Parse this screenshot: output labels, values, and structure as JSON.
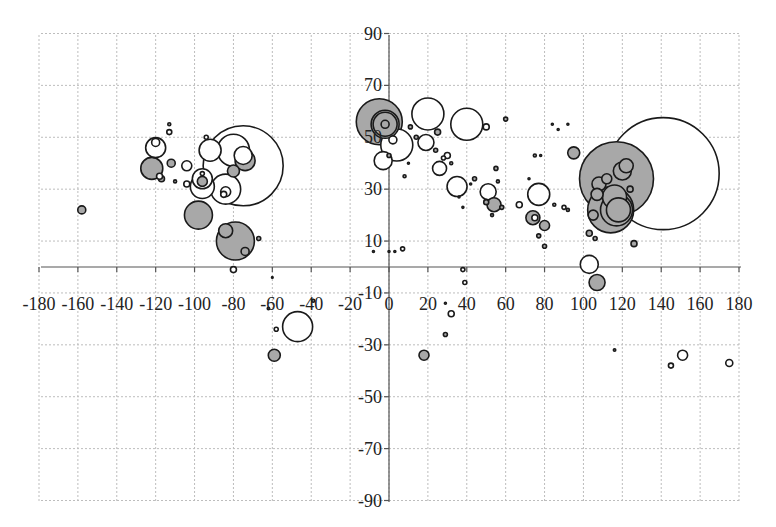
{
  "chart_data": {
    "type": "scatter",
    "subtype": "bubble",
    "title": "",
    "xlabel": "",
    "ylabel": "",
    "xlim": [
      -180,
      180
    ],
    "ylim": [
      -90,
      90
    ],
    "grid": true,
    "legend": null,
    "x_ticks": [
      -180,
      -160,
      -140,
      -120,
      -100,
      -80,
      -60,
      -40,
      -20,
      0,
      20,
      40,
      60,
      80,
      100,
      120,
      140,
      160,
      180
    ],
    "x_tick_labels": [
      "-180",
      "-160",
      "-140",
      "-120",
      "-100",
      "-80",
      "-60",
      "-40",
      "-20",
      "0",
      "20",
      "40",
      "60",
      "80",
      "100",
      "120",
      "140",
      "160",
      "180"
    ],
    "y_ticks": [
      90,
      70,
      50,
      30,
      10,
      -10,
      -30,
      -50,
      -70,
      -90
    ],
    "y_tick_labels": [
      "90",
      "70",
      "50",
      "30",
      "10",
      "-10",
      "-30",
      "-50",
      "-70",
      "-90"
    ],
    "colors": {
      "filled": "#a8a8a8",
      "open": "#ffffff",
      "stroke": "#1a1a1a",
      "grid": "#bdbdbd"
    },
    "series": [
      {
        "name": "bubbles",
        "points": [
          {
            "x": -158,
            "y": 22,
            "r": 4,
            "fill": "filled"
          },
          {
            "x": -120,
            "y": 46,
            "r": 10,
            "fill": "open"
          },
          {
            "x": -120,
            "y": 48,
            "r": 4,
            "fill": "open"
          },
          {
            "x": -122,
            "y": 38,
            "r": 11,
            "fill": "filled"
          },
          {
            "x": -113,
            "y": 52,
            "r": 2.5,
            "fill": "open"
          },
          {
            "x": -113,
            "y": 55,
            "r": 1.5,
            "fill": "filled"
          },
          {
            "x": -112,
            "y": 40,
            "r": 4,
            "fill": "filled"
          },
          {
            "x": -104,
            "y": 39,
            "r": 5,
            "fill": "open"
          },
          {
            "x": -117,
            "y": 34,
            "r": 3,
            "fill": "filled"
          },
          {
            "x": -118,
            "y": 35,
            "r": 3,
            "fill": "open"
          },
          {
            "x": -110,
            "y": 33,
            "r": 1.5,
            "fill": "filled"
          },
          {
            "x": -104,
            "y": 32,
            "r": 3,
            "fill": "open"
          },
          {
            "x": -92,
            "y": 45,
            "r": 11,
            "fill": "open"
          },
          {
            "x": -94,
            "y": 50,
            "r": 2,
            "fill": "open"
          },
          {
            "x": -96,
            "y": 31,
            "r": 12,
            "fill": "open"
          },
          {
            "x": -96,
            "y": 34,
            "r": 10,
            "fill": "open"
          },
          {
            "x": -96,
            "y": 33,
            "r": 5,
            "fill": "filled"
          },
          {
            "x": -96,
            "y": 36,
            "r": 2,
            "fill": "open"
          },
          {
            "x": -75,
            "y": 39,
            "r": 40,
            "fill": "open"
          },
          {
            "x": -80,
            "y": 45,
            "r": 16,
            "fill": "open"
          },
          {
            "x": -74,
            "y": 41,
            "r": 10,
            "fill": "filled"
          },
          {
            "x": -75,
            "y": 43,
            "r": 9,
            "fill": "open"
          },
          {
            "x": -80,
            "y": 37,
            "r": 6,
            "fill": "filled"
          },
          {
            "x": -84,
            "y": 30,
            "r": 15,
            "fill": "open"
          },
          {
            "x": -84,
            "y": 29,
            "r": 5,
            "fill": "open"
          },
          {
            "x": -85,
            "y": 28,
            "r": 3,
            "fill": "open"
          },
          {
            "x": -98,
            "y": 20,
            "r": 14,
            "fill": "filled"
          },
          {
            "x": -79,
            "y": 10,
            "r": 19,
            "fill": "filled"
          },
          {
            "x": -84,
            "y": 14,
            "r": 7,
            "fill": "filled"
          },
          {
            "x": -74,
            "y": 6,
            "r": 4,
            "fill": "filled"
          },
          {
            "x": -67,
            "y": 11,
            "r": 2,
            "fill": "filled"
          },
          {
            "x": -80,
            "y": -1,
            "r": 3,
            "fill": "open"
          },
          {
            "x": -60,
            "y": -4,
            "r": 0.8,
            "fill": "filled"
          },
          {
            "x": -62,
            "y": -16,
            "r": 1.2,
            "fill": "filled"
          },
          {
            "x": -58,
            "y": -24,
            "r": 2,
            "fill": "open"
          },
          {
            "x": -47,
            "y": -23,
            "r": 15,
            "fill": "open"
          },
          {
            "x": -59,
            "y": -34,
            "r": 6,
            "fill": "filled"
          },
          {
            "x": -39,
            "y": -13,
            "r": 1.5,
            "fill": "filled"
          },
          {
            "x": -5,
            "y": 56,
            "r": 23,
            "fill": "filled"
          },
          {
            "x": -2,
            "y": 55,
            "r": 14,
            "fill": "filled"
          },
          {
            "x": -2,
            "y": 55,
            "r": 12,
            "fill": "filled"
          },
          {
            "x": -2,
            "y": 55,
            "r": 4,
            "fill": "filled"
          },
          {
            "x": 4,
            "y": 47,
            "r": 16,
            "fill": "open"
          },
          {
            "x": 2,
            "y": 49,
            "r": 4,
            "fill": "open"
          },
          {
            "x": -3,
            "y": 41,
            "r": 9,
            "fill": "open"
          },
          {
            "x": 0,
            "y": 43,
            "r": 2,
            "fill": "filled"
          },
          {
            "x": 20,
            "y": 59,
            "r": 16,
            "fill": "open"
          },
          {
            "x": 11,
            "y": 54,
            "r": 2,
            "fill": "filled"
          },
          {
            "x": 25,
            "y": 52,
            "r": 3,
            "fill": "filled"
          },
          {
            "x": 19,
            "y": 48,
            "r": 8,
            "fill": "open"
          },
          {
            "x": 14,
            "y": 50,
            "r": 2,
            "fill": "filled"
          },
          {
            "x": 10,
            "y": 40,
            "r": 1,
            "fill": "filled"
          },
          {
            "x": 40,
            "y": 55,
            "r": 16,
            "fill": "open"
          },
          {
            "x": 50,
            "y": 54,
            "r": 3,
            "fill": "open"
          },
          {
            "x": 60,
            "y": 57,
            "r": 2,
            "fill": "filled"
          },
          {
            "x": 8,
            "y": 35,
            "r": 1.5,
            "fill": "filled"
          },
          {
            "x": 24,
            "y": 45,
            "r": 2,
            "fill": "filled"
          },
          {
            "x": 28,
            "y": 42,
            "r": 2,
            "fill": "open"
          },
          {
            "x": 30,
            "y": 43,
            "r": 3,
            "fill": "open"
          },
          {
            "x": 26,
            "y": 38,
            "r": 7,
            "fill": "open"
          },
          {
            "x": 32,
            "y": 40,
            "r": 1.5,
            "fill": "filled"
          },
          {
            "x": 35,
            "y": 31,
            "r": 10,
            "fill": "open"
          },
          {
            "x": 44,
            "y": 34,
            "r": 2,
            "fill": "filled"
          },
          {
            "x": 42,
            "y": 32,
            "r": 1,
            "fill": "filled"
          },
          {
            "x": 38,
            "y": 23,
            "r": 1,
            "fill": "filled"
          },
          {
            "x": 36,
            "y": 27,
            "r": 1,
            "fill": "filled"
          },
          {
            "x": 56,
            "y": 33,
            "r": 1.5,
            "fill": "filled"
          },
          {
            "x": 55,
            "y": 38,
            "r": 2,
            "fill": "filled"
          },
          {
            "x": 51,
            "y": 29,
            "r": 8,
            "fill": "open"
          },
          {
            "x": 50,
            "y": 25,
            "r": 2.5,
            "fill": "filled"
          },
          {
            "x": 54,
            "y": 24,
            "r": 7,
            "fill": "filled"
          },
          {
            "x": 58,
            "y": 23,
            "r": 2,
            "fill": "filled"
          },
          {
            "x": 53,
            "y": 20,
            "r": 1.5,
            "fill": "filled"
          },
          {
            "x": 67,
            "y": 24,
            "r": 3,
            "fill": "open"
          },
          {
            "x": 77,
            "y": 28,
            "r": 11,
            "fill": "open"
          },
          {
            "x": 74,
            "y": 19,
            "r": 7,
            "fill": "filled"
          },
          {
            "x": 80,
            "y": 16,
            "r": 5,
            "fill": "filled"
          },
          {
            "x": 75,
            "y": 19,
            "r": 3,
            "fill": "open"
          },
          {
            "x": 72,
            "y": 34,
            "r": 1,
            "fill": "filled"
          },
          {
            "x": 78,
            "y": 43,
            "r": 1,
            "fill": "filled"
          },
          {
            "x": 75,
            "y": 43,
            "r": 1.5,
            "fill": "filled"
          },
          {
            "x": 80,
            "y": 8,
            "r": 2,
            "fill": "filled"
          },
          {
            "x": 77,
            "y": 12,
            "r": 2,
            "fill": "filled"
          },
          {
            "x": 85,
            "y": 24,
            "r": 1.5,
            "fill": "filled"
          },
          {
            "x": 90,
            "y": 23,
            "r": 2,
            "fill": "open"
          },
          {
            "x": 92,
            "y": 22,
            "r": 1.5,
            "fill": "filled"
          },
          {
            "x": 84,
            "y": 55,
            "r": 1,
            "fill": "filled"
          },
          {
            "x": 87,
            "y": 53,
            "r": 1,
            "fill": "filled"
          },
          {
            "x": 92,
            "y": 55,
            "r": 1,
            "fill": "filled"
          },
          {
            "x": 95,
            "y": 44,
            "r": 6,
            "fill": "filled"
          },
          {
            "x": 117,
            "y": 34,
            "r": 37,
            "fill": "filled"
          },
          {
            "x": 141,
            "y": 36,
            "r": 56,
            "fill": "open"
          },
          {
            "x": 116,
            "y": 27,
            "r": 12,
            "fill": "filled"
          },
          {
            "x": 114,
            "y": 22,
            "r": 23,
            "fill": "filled"
          },
          {
            "x": 117,
            "y": 22,
            "r": 16,
            "fill": "filled"
          },
          {
            "x": 118,
            "y": 22,
            "r": 12,
            "fill": "filled"
          },
          {
            "x": 120,
            "y": 37,
            "r": 9,
            "fill": "filled"
          },
          {
            "x": 122,
            "y": 39,
            "r": 7,
            "fill": "filled"
          },
          {
            "x": 108,
            "y": 32,
            "r": 7,
            "fill": "filled"
          },
          {
            "x": 107,
            "y": 28,
            "r": 6,
            "fill": "filled"
          },
          {
            "x": 112,
            "y": 34,
            "r": 5,
            "fill": "filled"
          },
          {
            "x": 105,
            "y": 20,
            "r": 5,
            "fill": "filled"
          },
          {
            "x": 103,
            "y": 13,
            "r": 3,
            "fill": "filled"
          },
          {
            "x": 106,
            "y": 11,
            "r": 2,
            "fill": "filled"
          },
          {
            "x": 126,
            "y": 9,
            "r": 3,
            "fill": "filled"
          },
          {
            "x": 124,
            "y": 30,
            "r": 3,
            "fill": "filled"
          },
          {
            "x": 103,
            "y": 1,
            "r": 9,
            "fill": "open"
          },
          {
            "x": 107,
            "y": -6,
            "r": 8,
            "fill": "filled"
          },
          {
            "x": 7,
            "y": 7,
            "r": 2,
            "fill": "open"
          },
          {
            "x": -8,
            "y": 6,
            "r": 1,
            "fill": "filled"
          },
          {
            "x": 0,
            "y": 6,
            "r": 1,
            "fill": "filled"
          },
          {
            "x": 3,
            "y": 6,
            "r": 1,
            "fill": "filled"
          },
          {
            "x": 38,
            "y": -1,
            "r": 2,
            "fill": "open"
          },
          {
            "x": 39,
            "y": -6,
            "r": 2,
            "fill": "open"
          },
          {
            "x": 29,
            "y": -14,
            "r": 1,
            "fill": "filled"
          },
          {
            "x": 32,
            "y": -18,
            "r": 3,
            "fill": "open"
          },
          {
            "x": 29,
            "y": -26,
            "r": 2,
            "fill": "filled"
          },
          {
            "x": 18,
            "y": -34,
            "r": 5,
            "fill": "filled"
          },
          {
            "x": 116,
            "y": -32,
            "r": 1.2,
            "fill": "filled"
          },
          {
            "x": 145,
            "y": -38,
            "r": 2.5,
            "fill": "open"
          },
          {
            "x": 151,
            "y": -34,
            "r": 5,
            "fill": "open"
          },
          {
            "x": 175,
            "y": -37,
            "r": 3.5,
            "fill": "open"
          }
        ]
      }
    ]
  },
  "footer": {
    "text": ""
  }
}
